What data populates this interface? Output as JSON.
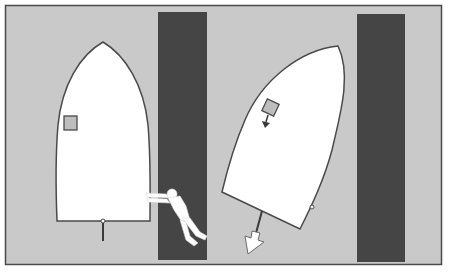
{
  "diagram": {
    "colors": {
      "page": "#ffffff",
      "frame_bg": "#c9c9c9",
      "frame_border": "#4a4a4a",
      "dock": "#454545",
      "hull_fill": "#ffffff",
      "hull_stroke": "#4a4a4a",
      "cabin_fill": "#bdbdbd",
      "arrow_fill": "#ffffff"
    },
    "panels": [
      {
        "id": "left",
        "boat_state": "upright, alongside dock",
        "has_person_pushing": true,
        "has_rudder": true
      },
      {
        "id": "right",
        "boat_state": "rotated, stern swinging away",
        "has_motion_arrow": true,
        "has_cabin_arrow": true
      }
    ]
  }
}
